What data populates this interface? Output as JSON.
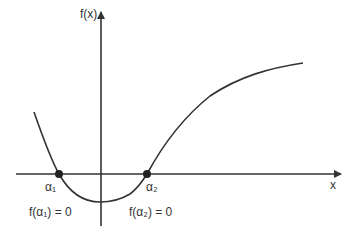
{
  "diagram": {
    "y_axis_label": "f(x)",
    "x_axis_label": "x",
    "roots": [
      {
        "symbol": "α₁",
        "equation": "f(α₁) = 0"
      },
      {
        "symbol": "α₂",
        "equation": "f(α₂) = 0"
      }
    ],
    "colors": {
      "line": "#333333",
      "background": "#ffffff"
    }
  }
}
